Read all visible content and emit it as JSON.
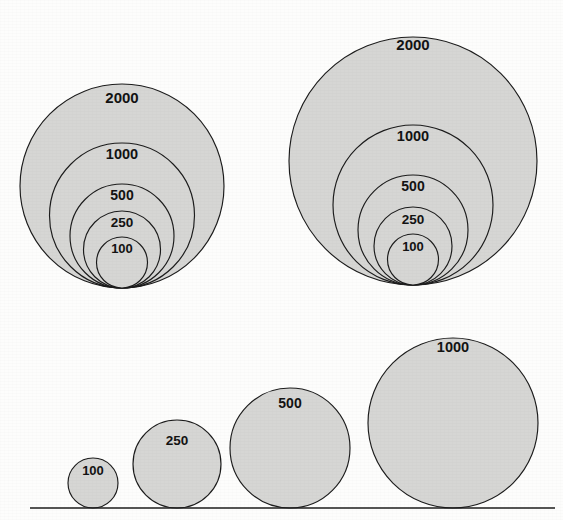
{
  "figure": {
    "background_color": "#fdfdfc",
    "circle_fill": "#d6d6d4",
    "circle_stroke": "#1c1c1c",
    "label_color": "#131313",
    "width": 563,
    "height": 520
  },
  "chart_data": {
    "type": "bubble",
    "subtitle": "",
    "xlabel": "",
    "ylabel": "",
    "grid": false,
    "legend": null,
    "annotations": [],
    "groups": [
      {
        "name": "nested-group-left",
        "layout": "nested-bottom-tangent",
        "tangent_point": {
          "x": 122,
          "y": 288
        },
        "circles": [
          {
            "label": "2000",
            "value": 2000,
            "radius": 102,
            "cx": 122,
            "cy": 186,
            "label_x": 122,
            "label_y": 99
          },
          {
            "label": "1000",
            "value": 1000,
            "radius": 72.5,
            "cx": 122,
            "cy": 215.5,
            "label_x": 122,
            "label_y": 155
          },
          {
            "label": "500",
            "value": 500,
            "radius": 52,
            "cx": 122,
            "cy": 236,
            "label_x": 122,
            "label_y": 196
          },
          {
            "label": "250",
            "value": 250,
            "radius": 38.5,
            "cx": 122,
            "cy": 249.5,
            "label_x": 122,
            "label_y": 223
          },
          {
            "label": "100",
            "value": 100,
            "radius": 25.5,
            "cx": 122,
            "cy": 262.5,
            "label_x": 122,
            "label_y": 250
          }
        ]
      },
      {
        "name": "nested-group-right",
        "layout": "nested-bottom-tangent",
        "tangent_point": {
          "x": 413,
          "y": 285
        },
        "circles": [
          {
            "label": "2000",
            "value": 2000,
            "radius": 124,
            "cx": 413,
            "cy": 161,
            "label_x": 413,
            "label_y": 46
          },
          {
            "label": "1000",
            "value": 1000,
            "radius": 80,
            "cx": 413,
            "cy": 205,
            "label_x": 413,
            "label_y": 137
          },
          {
            "label": "500",
            "value": 500,
            "radius": 55,
            "cx": 413,
            "cy": 230,
            "label_x": 413,
            "label_y": 187
          },
          {
            "label": "250",
            "value": 250,
            "radius": 39,
            "cx": 413,
            "cy": 246,
            "label_x": 413,
            "label_y": 220
          },
          {
            "label": "100",
            "value": 100,
            "radius": 25.5,
            "cx": 413,
            "cy": 259.5,
            "label_x": 413,
            "label_y": 248
          }
        ]
      },
      {
        "name": "baseline-row",
        "layout": "separate-on-baseline",
        "baseline": {
          "y": 508,
          "x_start": 30,
          "x_end": 555
        },
        "circles": [
          {
            "label": "100",
            "value": 100,
            "radius": 25,
            "cx": 93,
            "cy": 483,
            "label_x": 93,
            "label_y": 472
          },
          {
            "label": "250",
            "value": 250,
            "radius": 44,
            "cx": 177,
            "cy": 464,
            "label_x": 177,
            "label_y": 441
          },
          {
            "label": "500",
            "value": 500,
            "radius": 60,
            "cx": 290,
            "cy": 448,
            "label_x": 290,
            "label_y": 404
          },
          {
            "label": "1000",
            "value": 1000,
            "radius": 85,
            "cx": 453,
            "cy": 423,
            "label_x": 453,
            "label_y": 348
          }
        ]
      }
    ]
  }
}
